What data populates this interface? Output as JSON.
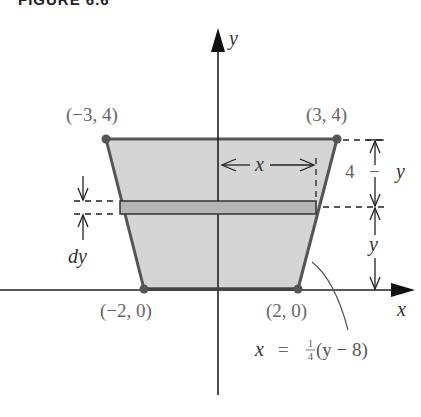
{
  "figure": {
    "caption": "FIGURE 6.6",
    "axes": {
      "x_label": "x",
      "y_label": "y"
    },
    "vertices": [
      {
        "label": "(−3, 4)",
        "x": -3,
        "y": 4
      },
      {
        "label": "(3, 4)",
        "x": 3,
        "y": 4
      },
      {
        "label": "(−2, 0)",
        "x": -2,
        "y": 0
      },
      {
        "label": "(2, 0)",
        "x": 2,
        "y": 0
      }
    ],
    "strip": {
      "width_label": "x",
      "thickness_label": "dy"
    },
    "dimensions": {
      "upper_label_num": "4",
      "upper_label_minus": "−",
      "upper_label_var": "y",
      "lower_label": "y"
    },
    "equation": {
      "lhs": "x",
      "eq": "=",
      "frac_num": "1",
      "frac_den": "4",
      "rest": "(y − 8)"
    },
    "colors": {
      "fill": "#d4d4d4",
      "strip_fill": "#b8b8b8",
      "outline": "#555555",
      "axis": "#222222"
    }
  }
}
